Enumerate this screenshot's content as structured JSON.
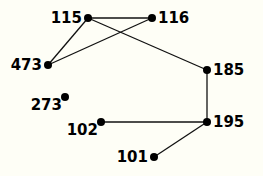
{
  "diagram": {
    "type": "graph",
    "background": "#fefef6",
    "node_color": "#000000",
    "edge_color": "#111111",
    "nodes": [
      {
        "id": "115",
        "label": "115",
        "x": 88,
        "y": 18,
        "label_side": "left"
      },
      {
        "id": "116",
        "label": "116",
        "x": 152,
        "y": 18,
        "label_side": "right"
      },
      {
        "id": "473",
        "label": "473",
        "x": 48,
        "y": 65,
        "label_side": "left"
      },
      {
        "id": "185",
        "label": "185",
        "x": 207,
        "y": 70,
        "label_side": "right"
      },
      {
        "id": "273",
        "label": "273",
        "x": 65,
        "y": 97,
        "label_side": "left-below"
      },
      {
        "id": "102",
        "label": "102",
        "x": 101,
        "y": 122,
        "label_side": "left-below"
      },
      {
        "id": "195",
        "label": "195",
        "x": 207,
        "y": 122,
        "label_side": "right"
      },
      {
        "id": "101",
        "label": "101",
        "x": 154,
        "y": 157,
        "label_side": "left"
      }
    ],
    "edges": [
      {
        "from": "115",
        "to": "116"
      },
      {
        "from": "115",
        "to": "473"
      },
      {
        "from": "116",
        "to": "473"
      },
      {
        "from": "115",
        "to": "185"
      },
      {
        "from": "185",
        "to": "195"
      },
      {
        "from": "102",
        "to": "195"
      },
      {
        "from": "195",
        "to": "101"
      }
    ]
  }
}
